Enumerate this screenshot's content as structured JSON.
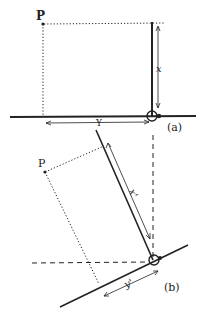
{
  "figure_a": {
    "point_label": "P",
    "height_label": "x",
    "width_label": "Y",
    "panel_label": "(a)"
  },
  "figure_b": {
    "point_label": "P",
    "height_label": "x'",
    "width_label": "y'",
    "panel_label": "(b)"
  },
  "colors": {
    "ink": "#222222",
    "background": "#ffffff"
  }
}
